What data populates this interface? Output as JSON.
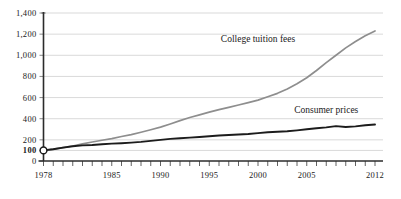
{
  "chart_data": {
    "type": "line",
    "title": "",
    "subtitle": "",
    "xlabel": "",
    "ylabel": "",
    "grid": true,
    "legend_position": "inline-annotations",
    "xlim": [
      1978,
      2012
    ],
    "ylim": [
      0,
      1400
    ],
    "index_base": {
      "year": 1978,
      "value": 100,
      "marker": "open-circle"
    },
    "yticks": [
      0,
      100,
      200,
      400,
      600,
      800,
      1000,
      1200,
      1400
    ],
    "ytick_labels": [
      "0",
      "100",
      "200",
      "400",
      "600",
      "800",
      "1,000",
      "1,200",
      "1,400"
    ],
    "ytick_bold": [
      100
    ],
    "xticks": [
      1978,
      1985,
      1990,
      1995,
      2000,
      2005,
      2012
    ],
    "xtick_labels": [
      "1978",
      "1985",
      "1990",
      "1995",
      "2000",
      "2005",
      "2012"
    ],
    "xtick_minor_step": 1,
    "colors": {
      "college_tuition_fees": "#8e8e8e",
      "consumer_prices": "#1c1c1c",
      "gridlines": "#c9c9c9",
      "axis": "#2b2b2b",
      "text": "#1a1a1a",
      "background": "#ffffff"
    },
    "x": [
      1978,
      1979,
      1980,
      1981,
      1982,
      1983,
      1984,
      1985,
      1986,
      1987,
      1988,
      1989,
      1990,
      1991,
      1992,
      1993,
      1994,
      1995,
      1996,
      1997,
      1998,
      1999,
      2000,
      2001,
      2002,
      2003,
      2004,
      2005,
      2006,
      2007,
      2008,
      2009,
      2010,
      2011,
      2012
    ],
    "series": [
      {
        "name": "College tuition fees",
        "label": "College tuition fees",
        "color": "#8e8e8e",
        "label_x_year": 2000,
        "label_y_value": 1130,
        "values": [
          100,
          112,
          126,
          142,
          162,
          180,
          196,
          212,
          232,
          250,
          272,
          296,
          320,
          350,
          382,
          412,
          436,
          462,
          486,
          508,
          530,
          552,
          576,
          608,
          640,
          682,
          730,
          788,
          856,
          930,
          1000,
          1070,
          1130,
          1185,
          1230
        ]
      },
      {
        "name": "Consumer prices",
        "label": "Consumer prices",
        "color": "#1c1c1c",
        "label_x_year": 2007,
        "label_y_value": 455,
        "values": [
          100,
          111,
          126,
          139,
          148,
          152,
          159,
          164,
          168,
          174,
          181,
          190,
          200,
          209,
          215,
          221,
          227,
          234,
          241,
          246,
          250,
          256,
          264,
          272,
          276,
          282,
          290,
          300,
          310,
          318,
          330,
          322,
          328,
          338,
          345
        ]
      }
    ],
    "annotations": [
      {
        "text": "College tuition fees",
        "at_year": 2000,
        "at_value": 1130
      },
      {
        "text": "Consumer prices",
        "at_year": 2007,
        "at_value": 455
      }
    ]
  }
}
